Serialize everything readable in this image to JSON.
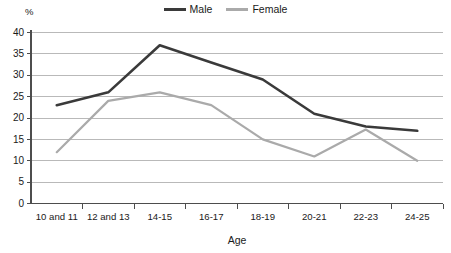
{
  "chart_data": {
    "type": "line",
    "title": "",
    "subtitle": "",
    "xlabel": "Age",
    "ylabel": "%",
    "categories": [
      "10 and 11",
      "12 and 13",
      "14-15",
      "16-17",
      "18-19",
      "20-21",
      "22-23",
      "24-25"
    ],
    "series": [
      {
        "name": "Male",
        "color": "#3a3a3a",
        "values": [
          23,
          26,
          37,
          33,
          29,
          21,
          18,
          17
        ]
      },
      {
        "name": "Female",
        "color": "#aaaaaa",
        "values": [
          12,
          24,
          26,
          23,
          15,
          11,
          17.3,
          10
        ]
      }
    ],
    "ylim": [
      0,
      40
    ],
    "ytick_values": [
      0,
      5,
      10,
      15,
      20,
      25,
      30,
      35,
      40
    ],
    "ytick_labels": [
      "0",
      "5",
      "10",
      "15",
      "20",
      "25",
      "30",
      "35",
      "40"
    ],
    "grid": true,
    "grid_axis": "y",
    "legend_position": "top-center",
    "legend_entries": [
      "Male",
      "Female"
    ]
  },
  "legend": {
    "male_label": "Male",
    "female_label": "Female"
  },
  "axes": {
    "y_unit_label": "%",
    "x_axis_title": "Age"
  }
}
